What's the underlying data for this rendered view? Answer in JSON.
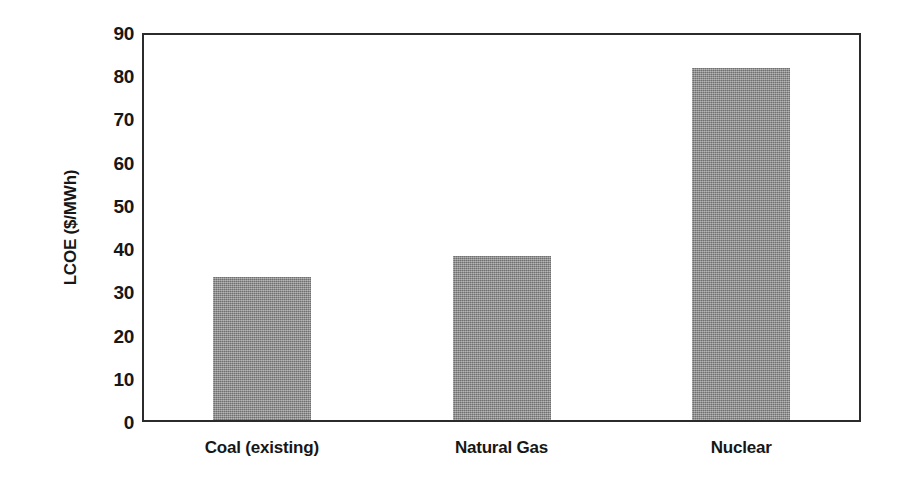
{
  "chart_data": {
    "type": "bar",
    "title": "",
    "xlabel": "",
    "ylabel": "LCOE ($/MWh)",
    "categories": [
      "Coal (existing)",
      "Natural Gas",
      "Nuclear"
    ],
    "values": [
      33,
      38,
      81.5
    ],
    "series": [
      {
        "name": "LCOE",
        "values": [
          33,
          38,
          81.5
        ]
      }
    ],
    "ylim": [
      0,
      90
    ],
    "ytick_step": 10,
    "yticks": [
      0,
      10,
      20,
      30,
      40,
      50,
      60,
      70,
      80,
      90
    ],
    "ytick_labels": [
      "0",
      "10",
      "20",
      "30",
      "40",
      "50",
      "60",
      "70",
      "80",
      "90"
    ],
    "grid": false,
    "legend": false,
    "legend_position": "none",
    "bar_color": "#8d8d8d",
    "frame_color": "#2b2b2b",
    "background_color": "#ffffff",
    "annotations": []
  }
}
